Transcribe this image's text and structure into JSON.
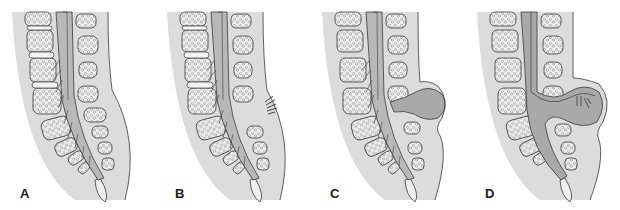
{
  "figure": {
    "colors": {
      "skin": "#dcdcdc",
      "bone_fill": "#efefef",
      "bone_texture": "#8a8a8a",
      "outline": "#3a3a3a",
      "cord": "#b8b8b8",
      "csf_sac": "#a9a9a9",
      "background": "#ffffff"
    },
    "panels": [
      {
        "id": "A",
        "label": "A",
        "variant": "normal"
      },
      {
        "id": "B",
        "label": "B",
        "variant": "spina-bifida-occulta-hair-tuft"
      },
      {
        "id": "C",
        "label": "C",
        "variant": "meningocele"
      },
      {
        "id": "D",
        "label": "D",
        "variant": "myelomeningocele"
      }
    ]
  }
}
